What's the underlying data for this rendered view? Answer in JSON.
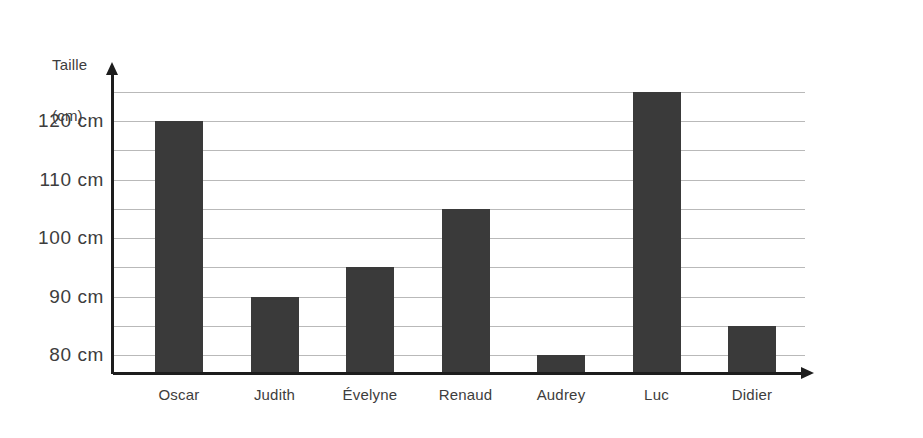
{
  "chart_data": {
    "type": "bar",
    "title": "",
    "xlabel": "Nombre d'enfants",
    "ylabel": "Taille (cm)",
    "ylabel_line1": "Taille",
    "ylabel_line2": "(cm)",
    "categories": [
      "Oscar",
      "Judith",
      "Évelyne",
      "Renaud",
      "Audrey",
      "Luc",
      "Didier"
    ],
    "values": [
      120,
      90,
      95,
      105,
      80,
      125,
      85
    ],
    "unit": "cm",
    "ylim": [
      75,
      127
    ],
    "grid": true,
    "grid_interval": 5,
    "gridline_values": [
      125,
      120,
      115,
      110,
      105,
      100,
      95,
      90,
      85,
      80
    ],
    "y_tick_labels": [
      "120 cm",
      "110 cm",
      "100 cm",
      "90 cm",
      "80 cm"
    ],
    "y_tick_values": [
      120,
      110,
      100,
      90,
      80
    ],
    "legend": null,
    "legend_position": "none",
    "bar_color": "#3a3a3a",
    "gridline_color": "#b9b9b9",
    "axis_color": "#1d1d1d",
    "text_color": "#3d3d3d",
    "background_color": "#ffffff"
  }
}
